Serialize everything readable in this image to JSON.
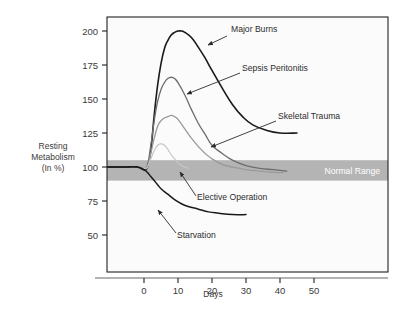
{
  "chart_data": {
    "type": "line",
    "title": "",
    "xlabel": "Days",
    "ylabel": "Resting Metabolism (In %)",
    "ylabel_lines": [
      "Resting",
      "Metabolism",
      "(In %)"
    ],
    "xlim": [
      -12,
      58
    ],
    "ylim": [
      36,
      212
    ],
    "grid": false,
    "legend_position": "inline-annotations",
    "x_ticks": [
      0,
      10,
      20,
      30,
      40,
      50
    ],
    "x_tick_labels": [
      "0",
      "10",
      "20",
      "30",
      "40",
      "50"
    ],
    "y_ticks": [
      50,
      75,
      100,
      125,
      150,
      175,
      200
    ],
    "y_tick_labels": [
      "50",
      "75",
      "100",
      "125",
      "150",
      "175",
      "200"
    ],
    "bands": [
      {
        "name": "Normal Range",
        "label": "Normal Range",
        "y_from": 90,
        "y_to": 105,
        "color": "#b4b4b4",
        "label_color": "#ffffff"
      }
    ],
    "series": [
      {
        "name": "Major Burns",
        "label": "Major Burns",
        "color": "#1a1a1a",
        "width": 1.6,
        "peak_value": 200,
        "peak_day": 11,
        "end_value": 125,
        "end_day": 45,
        "points": [
          [
            -12,
            100
          ],
          [
            -6,
            100
          ],
          [
            -2,
            100
          ],
          [
            0,
            98
          ],
          [
            1,
            100
          ],
          [
            2,
            112
          ],
          [
            3,
            138
          ],
          [
            4,
            160
          ],
          [
            5,
            176
          ],
          [
            6,
            187
          ],
          [
            7,
            193
          ],
          [
            8,
            197
          ],
          [
            9,
            199
          ],
          [
            10,
            200
          ],
          [
            11,
            200
          ],
          [
            12,
            199
          ],
          [
            14,
            195
          ],
          [
            16,
            188
          ],
          [
            18,
            180
          ],
          [
            20,
            171
          ],
          [
            23,
            158
          ],
          [
            26,
            146
          ],
          [
            29,
            137
          ],
          [
            32,
            131
          ],
          [
            36,
            127
          ],
          [
            40,
            125
          ],
          [
            45,
            125
          ]
        ]
      },
      {
        "name": "Sepsis Peritonitis",
        "label": "Sepsis Peritonitis",
        "color": "#6d6d6d",
        "width": 1.3,
        "peak_value": 166,
        "peak_day": 8,
        "end_value": 97,
        "end_day": 42,
        "points": [
          [
            0,
            99
          ],
          [
            1,
            101
          ],
          [
            2,
            116
          ],
          [
            3,
            134
          ],
          [
            4,
            148
          ],
          [
            5,
            157
          ],
          [
            6,
            162
          ],
          [
            7,
            165
          ],
          [
            8,
            166
          ],
          [
            9,
            165
          ],
          [
            10,
            162
          ],
          [
            12,
            153
          ],
          [
            14,
            142
          ],
          [
            16,
            132
          ],
          [
            18,
            124
          ],
          [
            20,
            116
          ],
          [
            23,
            110
          ],
          [
            26,
            105
          ],
          [
            30,
            101
          ],
          [
            34,
            99
          ],
          [
            38,
            98
          ],
          [
            42,
            97
          ]
        ]
      },
      {
        "name": "Skeletal Trauma",
        "label": "Skeletal Trauma",
        "color": "#9a9a9a",
        "width": 1.3,
        "peak_value": 138,
        "peak_day": 8,
        "end_value": 96,
        "end_day": 41,
        "points": [
          [
            0,
            99
          ],
          [
            1,
            100
          ],
          [
            2,
            110
          ],
          [
            3,
            121
          ],
          [
            4,
            130
          ],
          [
            5,
            134
          ],
          [
            6,
            136
          ],
          [
            7,
            137
          ],
          [
            8,
            138
          ],
          [
            9,
            137
          ],
          [
            10,
            135
          ],
          [
            12,
            128
          ],
          [
            14,
            121
          ],
          [
            16,
            115
          ],
          [
            18,
            110
          ],
          [
            20,
            106
          ],
          [
            23,
            102
          ],
          [
            26,
            100
          ],
          [
            30,
            98
          ],
          [
            34,
            97
          ],
          [
            38,
            96
          ],
          [
            41,
            96
          ]
        ]
      },
      {
        "name": "Elective Operation",
        "label": "Elective Operation",
        "color": "#c6c6c6",
        "width": 1.2,
        "peak_value": 117,
        "peak_day": 5,
        "end_value": 99,
        "end_day": 13,
        "points": [
          [
            0,
            99
          ],
          [
            1,
            100
          ],
          [
            2,
            106
          ],
          [
            3,
            112
          ],
          [
            4,
            116
          ],
          [
            5,
            117
          ],
          [
            6,
            116
          ],
          [
            7,
            113
          ],
          [
            8,
            109
          ],
          [
            9,
            106
          ],
          [
            10,
            103
          ],
          [
            11,
            101
          ],
          [
            12,
            100
          ],
          [
            13,
            99
          ]
        ]
      },
      {
        "name": "Starvation",
        "label": "Starvation",
        "color": "#1a1a1a",
        "width": 1.5,
        "end_value": 65,
        "end_day": 30,
        "points": [
          [
            -12,
            100
          ],
          [
            -6,
            100
          ],
          [
            -2,
            100
          ],
          [
            0,
            98
          ],
          [
            1,
            96
          ],
          [
            2,
            93
          ],
          [
            3,
            90
          ],
          [
            4,
            87
          ],
          [
            5,
            84
          ],
          [
            7,
            80
          ],
          [
            9,
            76
          ],
          [
            11,
            73
          ],
          [
            13,
            71
          ],
          [
            16,
            69
          ],
          [
            19,
            67
          ],
          [
            22,
            66
          ],
          [
            26,
            65
          ],
          [
            30,
            65
          ]
        ]
      }
    ],
    "annotations": [
      {
        "name": "major-burns",
        "text": "Major Burns",
        "text_x": 231,
        "text_y": 32,
        "arrow_from_x": 227,
        "arrow_from_y": 36,
        "arrow_to_x": 208,
        "arrow_to_y": 45
      },
      {
        "name": "sepsis-peritonitis",
        "text": "Sepsis Peritonitis",
        "text_x": 242,
        "text_y": 71,
        "arrow_from_x": 240,
        "arrow_from_y": 73,
        "arrow_to_x": 187,
        "arrow_to_y": 94
      },
      {
        "name": "skeletal-trauma",
        "text": "Skeletal Trauma",
        "text_x": 278,
        "text_y": 119,
        "arrow_from_x": 276,
        "arrow_from_y": 121,
        "arrow_to_x": 211,
        "arrow_to_y": 147
      },
      {
        "name": "elective-operation",
        "text": "Elective Operation",
        "text_x": 197,
        "text_y": 200,
        "arrow_from_x": 196,
        "arrow_from_y": 196,
        "arrow_to_x": 180,
        "arrow_to_y": 172
      },
      {
        "name": "starvation",
        "text": "Starvation",
        "text_x": 177,
        "text_y": 238,
        "arrow_from_x": 176,
        "arrow_from_y": 233,
        "arrow_to_x": 158,
        "arrow_to_y": 210
      }
    ]
  },
  "figure": {
    "background_color": "#ffffff",
    "frame_color": "#222222",
    "plot_background": "#fbfbfb"
  }
}
